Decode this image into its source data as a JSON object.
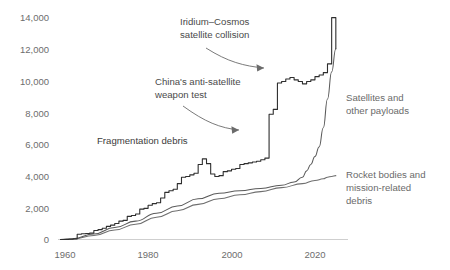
{
  "chart_data": {
    "type": "line",
    "title": "",
    "xlabel": "",
    "ylabel": "",
    "xlim": [
      1957,
      2024
    ],
    "ylim": [
      0,
      14000
    ],
    "grid": false,
    "legend_position": "inline-right",
    "x_ticks": [
      "1960",
      "1980",
      "2000",
      "2020"
    ],
    "x_tick_values": [
      1960,
      1980,
      2000,
      2020
    ],
    "y_ticks": [
      "0",
      "2,000",
      "4,000",
      "6,000",
      "8,000",
      "10,000",
      "12,000",
      "14,000"
    ],
    "y_tick_values": [
      0,
      2000,
      4000,
      6000,
      8000,
      10000,
      12000,
      14000
    ],
    "series": [
      {
        "name": "Fragmentation debris",
        "color": "#2e2e2e",
        "x": [
          1957,
          1958,
          1959,
          1960,
          1961,
          1962,
          1963,
          1964,
          1965,
          1966,
          1967,
          1968,
          1969,
          1970,
          1971,
          1972,
          1973,
          1974,
          1975,
          1976,
          1977,
          1978,
          1979,
          1980,
          1981,
          1982,
          1983,
          1984,
          1985,
          1986,
          1987,
          1988,
          1989,
          1990,
          1991,
          1992,
          1993,
          1994,
          1995,
          1996,
          1997,
          1998,
          1999,
          2000,
          2001,
          2002,
          2003,
          2004,
          2005,
          2006,
          2007,
          2008,
          2009,
          2010,
          2011,
          2012,
          2013,
          2014,
          2015,
          2016,
          2017,
          2018,
          2019,
          2020,
          2021,
          2022,
          2023
        ],
        "values": [
          0,
          0,
          20,
          40,
          330,
          360,
          380,
          400,
          560,
          620,
          700,
          820,
          900,
          1000,
          1150,
          1200,
          1450,
          1500,
          1600,
          1900,
          1950,
          2150,
          2250,
          2300,
          2600,
          2950,
          3050,
          3150,
          3500,
          3900,
          3950,
          4050,
          4150,
          4700,
          5050,
          4750,
          4100,
          3950,
          4000,
          4250,
          4300,
          4400,
          4450,
          4700,
          4750,
          4800,
          4850,
          4900,
          5000,
          5100,
          7850,
          8150,
          9800,
          9900,
          10050,
          10150,
          10000,
          9900,
          9750,
          9900,
          10000,
          10200,
          10300,
          10450,
          11000,
          13900,
          11950
        ]
      },
      {
        "name": "Satellites and other payloads",
        "color": "#5a5a5a",
        "x": [
          1957,
          1960,
          1965,
          1970,
          1975,
          1980,
          1985,
          1990,
          1995,
          2000,
          2005,
          2010,
          2013,
          2015,
          2016,
          2017,
          2018,
          2019,
          2020,
          2021,
          2022,
          2023
        ],
        "values": [
          0,
          50,
          350,
          750,
          1150,
          1650,
          2100,
          2550,
          2900,
          3050,
          3200,
          3400,
          3600,
          3900,
          4300,
          4700,
          5200,
          5800,
          7000,
          8800,
          10500,
          11950
        ]
      },
      {
        "name": "Rocket bodies and mission-related debris",
        "color": "#6f6f6f",
        "x": [
          1957,
          1960,
          1965,
          1970,
          1975,
          1980,
          1985,
          1990,
          1995,
          2000,
          2005,
          2010,
          2015,
          2018,
          2020,
          2021,
          2022,
          2023
        ],
        "values": [
          0,
          30,
          250,
          600,
          950,
          1400,
          1800,
          2200,
          2550,
          2800,
          3000,
          3250,
          3500,
          3700,
          3800,
          3900,
          3950,
          4000
        ]
      }
    ],
    "annotations": [
      {
        "name": "iridium-cosmos-annotation",
        "lines": [
          "Iridium–Cosmos",
          "satellite collision"
        ],
        "x": 180,
        "y": 18
      },
      {
        "name": "china-asat-annotation",
        "lines": [
          "China's anti-satellite",
          "weapon test"
        ],
        "x": 155,
        "y": 78
      },
      {
        "name": "fragmentation-debris-label",
        "lines": [
          "Fragmentation debris"
        ],
        "x": 97,
        "y": 140
      },
      {
        "name": "satellites-legend-label",
        "lines": [
          "Satellites and",
          "other payloads"
        ],
        "x": 346,
        "y": 97
      },
      {
        "name": "rocket-bodies-legend-label",
        "lines": [
          "Rocket bodies and",
          "mission-related",
          "debris"
        ],
        "x": 346,
        "y": 173
      }
    ]
  },
  "axis": {
    "y_labels": [
      "14,000",
      "12,000",
      "10,000",
      "8,000",
      "6,000",
      "4,000",
      "2,000",
      "0"
    ],
    "x_labels": [
      "1960",
      "1980",
      "2000",
      "2020"
    ]
  },
  "annotations_text": {
    "iridium_line1": "Iridium–Cosmos",
    "iridium_line2": "satellite collision",
    "china_line1": "China's anti-satellite",
    "china_line2": "weapon test",
    "fragmentation_label": "Fragmentation debris",
    "satellites_line1": "Satellites and",
    "satellites_line2": "other payloads",
    "rocket_line1": "Rocket bodies and",
    "rocket_line2": "mission-related",
    "rocket_line3": "debris"
  },
  "colors": {
    "fragmentation": "#2e2e2e",
    "satellites": "#5a5a5a",
    "rocket": "#6f6f6f",
    "axis": "#c9c9c9",
    "tick_text": "#6d6d6d",
    "annotation_text": "#4a4a4a",
    "legend_text": "#6a6a6a",
    "background": "#ffffff"
  }
}
